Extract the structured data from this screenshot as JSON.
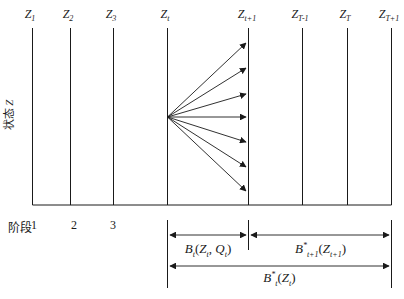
{
  "colors": {
    "ink": "#1a1a1a",
    "background": "#ffffff"
  },
  "y_axis_label_parts": [
    [
      "p",
      "状态 "
    ],
    [
      "t",
      "Z"
    ]
  ],
  "stage": {
    "caption": "阶段",
    "numbers": [
      "1",
      "2",
      "3"
    ]
  },
  "columns": [
    {
      "parts": [
        [
          "t",
          "Z"
        ],
        [
          "s",
          "1"
        ]
      ]
    },
    {
      "parts": [
        [
          "t",
          "Z"
        ],
        [
          "s",
          "2"
        ]
      ]
    },
    {
      "parts": [
        [
          "t",
          "Z"
        ],
        [
          "s",
          "3"
        ]
      ]
    },
    {
      "parts": [
        [
          "t",
          "Z"
        ],
        [
          "s",
          "t"
        ]
      ]
    },
    {
      "parts": [
        [
          "t",
          "Z"
        ],
        [
          "s",
          "t+1"
        ]
      ]
    },
    {
      "parts": [
        [
          "t",
          "Z"
        ],
        [
          "s",
          "T-1"
        ]
      ]
    },
    {
      "parts": [
        [
          "t",
          "Z"
        ],
        [
          "s",
          "T"
        ]
      ]
    },
    {
      "parts": [
        [
          "t",
          "Z"
        ],
        [
          "s",
          "T+1"
        ]
      ]
    }
  ],
  "annotations": {
    "benefit_t": [
      [
        "t",
        "B"
      ],
      [
        "s",
        "t"
      ],
      [
        "p",
        "("
      ],
      [
        "t",
        "Z"
      ],
      [
        "s",
        "t"
      ],
      [
        "p",
        ", "
      ],
      [
        "t",
        "Q"
      ],
      [
        "s",
        "t"
      ],
      [
        "p",
        ")"
      ]
    ],
    "benefit_next_optimal": [
      [
        "t",
        "B"
      ],
      [
        "u",
        "*"
      ],
      [
        "s",
        "t+1"
      ],
      [
        "p",
        "("
      ],
      [
        "t",
        "Z"
      ],
      [
        "s",
        "t+1"
      ],
      [
        "p",
        ")"
      ]
    ],
    "benefit_total_optimal": [
      [
        "t",
        "B"
      ],
      [
        "u",
        "*"
      ],
      [
        "s",
        "t"
      ],
      [
        "p",
        "("
      ],
      [
        "t",
        "Z"
      ],
      [
        "s",
        "t"
      ],
      [
        "p",
        ")"
      ]
    ]
  }
}
